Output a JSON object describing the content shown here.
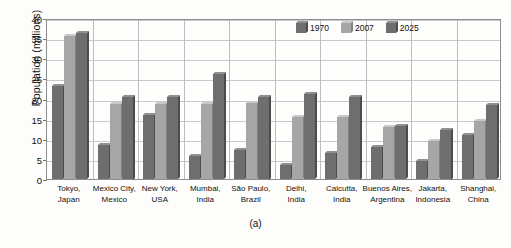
{
  "chart_data": {
    "type": "bar",
    "title": "",
    "subtitle": "",
    "xlabel": "",
    "ylabel": "Population (millions)",
    "ylim": [
      0,
      40
    ],
    "ytick_step": 5,
    "yticks": [
      "0",
      "5",
      "10",
      "15",
      "20",
      "25",
      "30",
      "35",
      "40"
    ],
    "grid": true,
    "legend_position": "top-right",
    "categories": [
      "Tokyo, Japan",
      "Mexico City, Mexico",
      "New York, USA",
      "Mumbai, India",
      "São Paulo, Brazil",
      "Delhi, India",
      "Calcutta, India",
      "Buenos Aires, Argentina",
      "Jakarta, Indonesia",
      "Shanghai, China"
    ],
    "category_lines": [
      [
        "Tokyo,",
        "Japan"
      ],
      [
        "Mexico City,",
        "Mexico"
      ],
      [
        "New York,",
        "USA"
      ],
      [
        "Mumbai,",
        "India"
      ],
      [
        "São Paulo,",
        "Brazil"
      ],
      [
        "Delhi,",
        "India"
      ],
      [
        "Calcutta,",
        "India"
      ],
      [
        "Buenos Aires,",
        "Argentina"
      ],
      [
        "Jakarta,",
        "Indonesia"
      ],
      [
        "Shanghai,",
        "China"
      ]
    ],
    "series": [
      {
        "name": "1970",
        "color": "#6e6e6e",
        "values": [
          23.0,
          8.5,
          16.0,
          5.8,
          7.2,
          3.5,
          6.5,
          8.0,
          4.5,
          11.0
        ]
      },
      {
        "name": "2007",
        "color": "#a6a6a6",
        "values": [
          35.5,
          18.7,
          18.7,
          18.7,
          18.8,
          15.5,
          15.5,
          12.8,
          9.5,
          14.5
        ]
      },
      {
        "name": "2025",
        "color": "#6e6e6e",
        "values": [
          36.2,
          20.5,
          20.3,
          26.0,
          20.5,
          21.0,
          20.5,
          13.2,
          12.3,
          18.5
        ]
      }
    ]
  },
  "legend": {
    "items": [
      {
        "label": "1970",
        "color": "#6e6e6e"
      },
      {
        "label": "2007",
        "color": "#a6a6a6"
      },
      {
        "label": "2025",
        "color": "#6e6e6e"
      }
    ]
  },
  "caption": "(a)",
  "colors": {
    "series_1970": "#6e6e6e",
    "series_2007": "#a6a6a6",
    "series_2025": "#6e6e6e",
    "grid": "#c9c9c9",
    "frame": "#8d8d8d",
    "background": "#fdfdfb",
    "text": "#111111"
  }
}
